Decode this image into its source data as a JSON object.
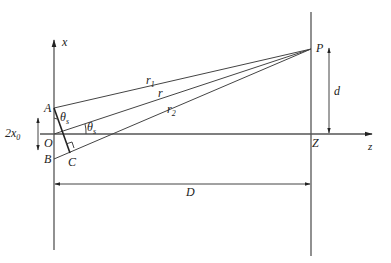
{
  "diagram": {
    "axes": {
      "x_label": "x",
      "z_label": "z"
    },
    "points": {
      "A": "A",
      "B": "B",
      "C": "C",
      "O": "O",
      "P": "P",
      "Z": "Z"
    },
    "rays": {
      "r1": "r",
      "r1_sub": "1",
      "r": "r",
      "r2": "r",
      "r2_sub": "2"
    },
    "angles": {
      "theta_s_at_A": "θ",
      "theta_s_at_A_sub": "s",
      "theta_s_at_O": "θ",
      "theta_s_at_O_sub": "s"
    },
    "dimensions": {
      "slit_sep": "2x",
      "slit_sep_sub": "0",
      "height_d": "d",
      "distance_D": "D"
    }
  }
}
